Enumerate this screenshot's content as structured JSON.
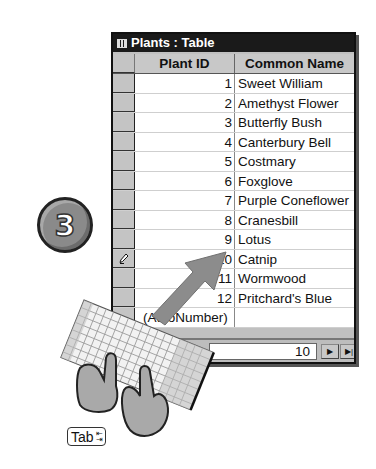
{
  "window": {
    "title": "Plants : Table",
    "title_icon": "datasheet-icon"
  },
  "table": {
    "columns": [
      "Plant ID",
      "Common Name"
    ],
    "rows": [
      {
        "id": "1",
        "name": "Sweet William",
        "selector": ""
      },
      {
        "id": "2",
        "name": "Amethyst Flower",
        "selector": ""
      },
      {
        "id": "3",
        "name": "Butterfly Bush",
        "selector": ""
      },
      {
        "id": "4",
        "name": "Canterbury Bell",
        "selector": ""
      },
      {
        "id": "5",
        "name": "Costmary",
        "selector": ""
      },
      {
        "id": "6",
        "name": "Foxglove",
        "selector": ""
      },
      {
        "id": "7",
        "name": "Purple Coneflower",
        "selector": ""
      },
      {
        "id": "8",
        "name": "Cranesbill",
        "selector": ""
      },
      {
        "id": "9",
        "name": "Lotus",
        "selector": ""
      },
      {
        "id": "10",
        "name": "Catnip",
        "selector": "pencil-icon"
      },
      {
        "id": "11",
        "name": "Wormwood",
        "selector": ""
      },
      {
        "id": "12",
        "name": "Pritchard's Blue",
        "selector": ""
      }
    ],
    "new_record": {
      "id": "(AutoNumber)",
      "name": ""
    }
  },
  "record_nav": {
    "label": "Record:",
    "current": "10",
    "buttons": [
      "first-record",
      "previous-record",
      "next-record",
      "last-record",
      "new-record"
    ]
  },
  "step": {
    "number": "3"
  },
  "key_hint": {
    "label": "Tab",
    "arrows": "tab-arrows-icon"
  },
  "colors": {
    "title_bar": "#1a1a1a",
    "header_bg": "#c8c8c8",
    "selector_bg": "#c4c4c4",
    "arrow": "#8c8c8c",
    "step_badge": "#8a8a8a"
  }
}
